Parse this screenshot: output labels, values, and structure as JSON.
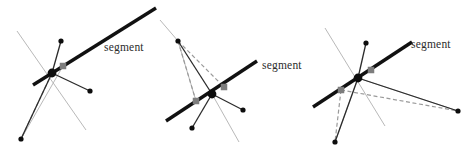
{
  "figure": {
    "width": 475,
    "height": 155,
    "background": "#ffffff",
    "panel_count": 3,
    "colors": {
      "segment_black": "#111111",
      "ray_black": "#2b2b2b",
      "light_gray_line": "#b9b9b9",
      "dashed_gray": "#9a9a9a",
      "marker_gray": "#7d7d7d",
      "vertex_black": "#0d0d0d",
      "label_text": "#2b2b2b"
    },
    "labels": {
      "segment": "segment"
    }
  },
  "panels": [
    {
      "id": "panel-left",
      "label": "segment",
      "label_pos": [
        104,
        41
      ],
      "vertex": [
        52,
        73
      ],
      "segment": {
        "from": [
          33,
          85
        ],
        "to": [
          156,
          8
        ],
        "width": 3.4
      },
      "markers": [
        [
          63,
          66
        ]
      ],
      "rays": [
        {
          "to": [
            61,
            41
          ],
          "endpoint": true
        },
        {
          "to": [
            90,
            91
          ],
          "endpoint": true
        },
        {
          "to": [
            21,
            139
          ],
          "endpoint": true
        }
      ],
      "light_lines": [
        {
          "from": [
            17,
            31
          ],
          "to": [
            86,
            130
          ]
        },
        {
          "from": [
            21,
            139
          ],
          "to": [
            63,
            66
          ]
        }
      ],
      "dashed": [
        {
          "from": [
            52,
            73
          ],
          "to": [
            21,
            139
          ]
        }
      ]
    },
    {
      "id": "panel-middle",
      "label": "segment",
      "label_pos": [
        262,
        59
      ],
      "vertex": [
        212,
        94
      ],
      "segment": {
        "from": [
          166,
          121
        ],
        "to": [
          257,
          61
        ],
        "width": 3.4
      },
      "markers": [
        [
          196,
          101
        ],
        [
          224,
          87
        ]
      ],
      "rays": [
        {
          "to": [
            178,
            41
          ],
          "endpoint": true
        },
        {
          "to": [
            243,
            110
          ],
          "endpoint": true
        },
        {
          "to": [
            192,
            128
          ],
          "endpoint": true
        }
      ],
      "light_lines": [
        {
          "from": [
            160,
            20
          ],
          "to": [
            178,
            41
          ]
        },
        {
          "from": [
            212,
            94
          ],
          "to": [
            239,
            142
          ]
        },
        {
          "from": [
            178,
            41
          ],
          "to": [
            196,
            101
          ]
        }
      ],
      "dashed": [
        {
          "from": [
            178,
            41
          ],
          "to": [
            196,
            101
          ]
        },
        {
          "from": [
            178,
            41
          ],
          "to": [
            224,
            87
          ]
        }
      ]
    },
    {
      "id": "panel-right",
      "label": "segment",
      "label_pos": [
        411,
        38
      ],
      "vertex": [
        358,
        78
      ],
      "segment": {
        "from": [
          313,
          107
        ],
        "to": [
          412,
          42
        ],
        "width": 3.4
      },
      "markers": [
        [
          341,
          90
        ],
        [
          371,
          70
        ]
      ],
      "rays": [
        {
          "to": [
            366,
            43
          ],
          "endpoint": true
        },
        {
          "to": [
            458,
            111
          ],
          "endpoint": true
        },
        {
          "to": [
            335,
            142
          ],
          "endpoint": true
        }
      ],
      "light_lines": [
        {
          "from": [
            325,
            28
          ],
          "to": [
            385,
            126
          ]
        },
        {
          "from": [
            358,
            78
          ],
          "to": [
            335,
            142
          ]
        },
        {
          "from": [
            358,
            78
          ],
          "to": [
            458,
            111
          ]
        }
      ],
      "dashed": [
        {
          "from": [
            341,
            90
          ],
          "to": [
            458,
            111
          ]
        },
        {
          "from": [
            341,
            90
          ],
          "to": [
            335,
            142
          ]
        }
      ]
    }
  ]
}
